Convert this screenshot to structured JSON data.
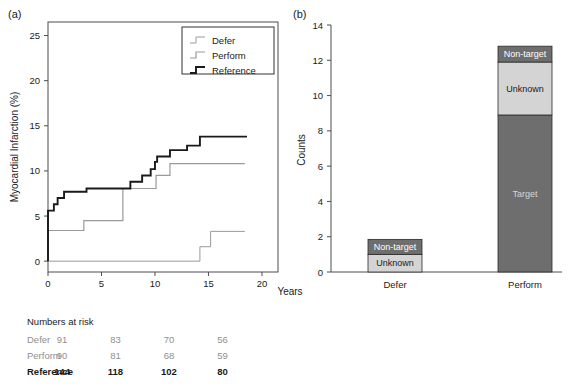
{
  "figure": {
    "panel_a_label": "(a)",
    "panel_b_label": "(b)"
  },
  "chart_data": [
    {
      "id": "panel-a",
      "type": "line",
      "title": "",
      "xlabel": "Years",
      "ylabel": "Myocardial Infarction (%)",
      "xlim": [
        0,
        21.5
      ],
      "ylim": [
        -1.2,
        26.5
      ],
      "xticks": [
        0,
        5,
        10,
        15,
        20
      ],
      "xticklabels": [
        "0",
        "5",
        "10",
        "15",
        "20"
      ],
      "yticks": [
        0,
        5,
        10,
        15,
        20,
        25
      ],
      "yticklabels": [
        "0",
        "5",
        "10",
        "15",
        "20",
        "25"
      ],
      "grid": false,
      "legend_position": "top-right",
      "legend": [
        "Defer",
        "Perform",
        "Reference"
      ],
      "step_type": "post",
      "series": [
        {
          "name": "Defer",
          "color": "#9a9a9a",
          "width": 1.0,
          "points": [
            [
              0,
              0
            ],
            [
              14.2,
              0
            ],
            [
              14.2,
              1.6
            ],
            [
              15.2,
              1.6
            ],
            [
              15.2,
              3.3
            ],
            [
              18.4,
              3.3
            ]
          ]
        },
        {
          "name": "Perform",
          "color": "#9a9a9a",
          "width": 1.2,
          "points": [
            [
              0,
              0
            ],
            [
              0,
              3.4
            ],
            [
              3.35,
              3.4
            ],
            [
              3.35,
              4.5
            ],
            [
              7.0,
              4.5
            ],
            [
              7.0,
              8.05
            ],
            [
              10.1,
              8.05
            ],
            [
              10.1,
              9.5
            ],
            [
              11.4,
              9.5
            ],
            [
              11.4,
              10.8
            ],
            [
              18.4,
              10.8
            ]
          ]
        },
        {
          "name": "Reference",
          "color": "#1a1a1a",
          "width": 1.9,
          "points": [
            [
              0,
              0
            ],
            [
              0,
              5.6
            ],
            [
              0.55,
              5.6
            ],
            [
              0.55,
              6.3
            ],
            [
              0.9,
              6.3
            ],
            [
              0.9,
              7.0
            ],
            [
              1.5,
              7.0
            ],
            [
              1.5,
              7.7
            ],
            [
              3.6,
              7.7
            ],
            [
              3.6,
              8.05
            ],
            [
              7.7,
              8.05
            ],
            [
              7.7,
              8.8
            ],
            [
              8.8,
              8.8
            ],
            [
              8.8,
              9.5
            ],
            [
              9.6,
              9.5
            ],
            [
              9.6,
              10.2
            ],
            [
              10.0,
              10.2
            ],
            [
              10.0,
              11.0
            ],
            [
              10.2,
              11.0
            ],
            [
              10.2,
              11.6
            ],
            [
              11.4,
              11.6
            ],
            [
              11.4,
              12.3
            ],
            [
              13.0,
              12.3
            ],
            [
              13.0,
              12.8
            ],
            [
              14.2,
              12.8
            ],
            [
              14.2,
              13.8
            ],
            [
              18.6,
              13.8
            ]
          ]
        }
      ],
      "numbers_at_risk": {
        "title": "Numbers at risk",
        "time_points": [
          0,
          5,
          10,
          15
        ],
        "rows": [
          {
            "label": "Defer",
            "values": [
              "91",
              "83",
              "70",
              "56"
            ],
            "color": "#8f8f8f",
            "bold": false
          },
          {
            "label": "Perform",
            "values": [
              "90",
              "81",
              "68",
              "59"
            ],
            "color": "#8f8f8f",
            "bold": false
          },
          {
            "label": "Reference",
            "values": [
              "144",
              "118",
              "102",
              "80"
            ],
            "color": "#1a1a1a",
            "bold": true
          }
        ]
      }
    },
    {
      "id": "panel-b",
      "type": "bar",
      "stacked": true,
      "title": "",
      "xlabel": "",
      "ylabel": "Counts",
      "ylim": [
        0,
        14
      ],
      "yticks": [
        0,
        2,
        4,
        6,
        8,
        10,
        12,
        14
      ],
      "yticklabels": [
        "0",
        "2",
        "4",
        "6",
        "8",
        "10",
        "12",
        "14"
      ],
      "categories": [
        "Defer",
        "Perform"
      ],
      "grid": false,
      "segments": [
        {
          "name": "Target",
          "color": "#6e6e6e",
          "text_color": "#d5d5d5",
          "values": [
            0,
            8.9
          ]
        },
        {
          "name": "Unknown",
          "color": "#d4d4d4",
          "text_color": "#1a1a1a",
          "values": [
            1.0,
            3.0
          ]
        },
        {
          "name": "Non-target",
          "color": "#6e6e6e",
          "text_color": "#ffffff",
          "values": [
            0.85,
            0.9
          ]
        }
      ],
      "bar_labels": [
        [
          "Unknown",
          "Non-target"
        ],
        [
          "Target",
          "Unknown",
          "Non-target"
        ]
      ]
    }
  ]
}
